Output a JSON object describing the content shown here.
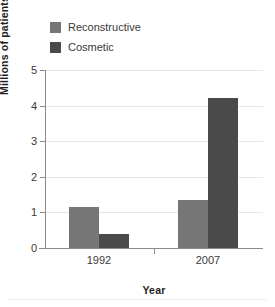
{
  "chart_data": {
    "type": "bar",
    "title": "",
    "xlabel": "Year",
    "ylabel": "Millions of patients",
    "categories": [
      "1992",
      "2007"
    ],
    "series": [
      {
        "name": "Reconstructive",
        "values": [
          1.15,
          1.35
        ],
        "color": "#767676"
      },
      {
        "name": "Cosmetic",
        "values": [
          0.4,
          4.2
        ],
        "color": "#4a4a4a"
      }
    ],
    "ylim": [
      0,
      5
    ],
    "yticks": [
      0,
      1,
      2,
      3,
      4,
      5
    ],
    "ytick_labels": [
      "0",
      "1",
      "2",
      "3",
      "4",
      "5"
    ],
    "grid": true,
    "legend_position": "top-left",
    "grid_color": "#e6e6e6",
    "axis_color": "#8a8a8a"
  },
  "legend": {
    "items": [
      {
        "label": "Reconstructive"
      },
      {
        "label": "Cosmetic"
      }
    ]
  },
  "axes": {
    "y_title": "Millions of patients",
    "x_title": "Year",
    "y_tick_0": "0",
    "y_tick_1": "1",
    "y_tick_2": "2",
    "y_tick_3": "3",
    "y_tick_4": "4",
    "y_tick_5": "5",
    "x_cat_0": "1992",
    "x_cat_1": "2007"
  }
}
